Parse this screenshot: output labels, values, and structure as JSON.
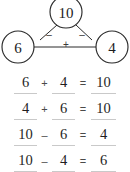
{
  "diagram": {
    "name": "number-bond-triangle",
    "whole": "10",
    "part_left": "6",
    "part_right": "4",
    "op_left": "–",
    "op_right": "–",
    "op_bottom": "+",
    "stroke_color": "#2b2b2b",
    "fill_color": "#ffffff"
  },
  "equations": {
    "rule_color": "#c9c9c9",
    "rows": [
      {
        "a": "6",
        "op": "+",
        "b": "4",
        "eq": "=",
        "c": "10"
      },
      {
        "a": "4",
        "op": "+",
        "b": "6",
        "eq": "=",
        "c": "10"
      },
      {
        "a": "10",
        "op": "–",
        "b": "6",
        "eq": "=",
        "c": "4"
      },
      {
        "a": "10",
        "op": "–",
        "b": "4",
        "eq": "=",
        "c": "6"
      }
    ]
  }
}
